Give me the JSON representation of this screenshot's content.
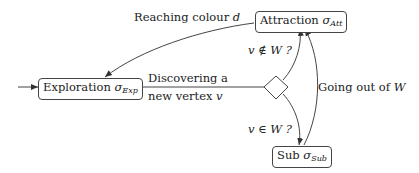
{
  "nodes": {
    "exploration": {
      "label": "Exploration",
      "sigma": "σ",
      "sub": "Exp"
    },
    "attraction": {
      "label": "Attraction",
      "sigma": "σ",
      "sub": "Att"
    },
    "sub": {
      "label": "Sub",
      "sigma": "σ",
      "sub": "Sub"
    }
  },
  "edges": {
    "reaching": {
      "text": "Reaching colour ",
      "var": "d"
    },
    "discovering_line1": "Discovering a",
    "discovering_line2": "new vertex ",
    "discovering_var": "v",
    "not_in_w": "v ∉ W ?",
    "in_w": "v ∈ W ?",
    "going_out": "Going out of ",
    "going_out_var": "W"
  },
  "colors": {
    "stroke": "#444444",
    "text": "#222222"
  }
}
